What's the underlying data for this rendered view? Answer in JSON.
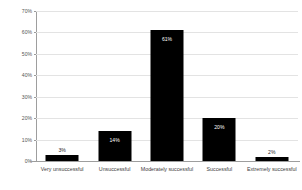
{
  "chart_data": {
    "type": "bar",
    "title": "",
    "xlabel": "",
    "ylabel": "Percent of respondents",
    "categories": [
      "Very unsuccessful",
      "Unsuccessful",
      "Moderately successful",
      "Successful",
      "Extremely successful"
    ],
    "values": [
      3,
      14,
      61,
      20,
      2
    ],
    "data_labels": [
      "3%",
      "14%",
      "61%",
      "20%",
      "2%"
    ],
    "label_placement": [
      "outside",
      "inside",
      "inside",
      "inside",
      "outside"
    ],
    "ylim": [
      0,
      70
    ],
    "yticks": [
      0,
      10,
      20,
      30,
      40,
      50,
      60,
      70
    ],
    "ytick_labels": [
      "0%",
      "10%",
      "20%",
      "30%",
      "40%",
      "50%",
      "60%",
      "70%"
    ],
    "grid": true,
    "grid_axis": "y",
    "legend": "none",
    "bar_color": "#000000",
    "gridline_color": "#e3e3e3",
    "axis_color": "#9e9e9e",
    "background_color": "#ffffff",
    "inside_label_color": "#ffffff",
    "outside_label_color": "#2b2b2b"
  }
}
